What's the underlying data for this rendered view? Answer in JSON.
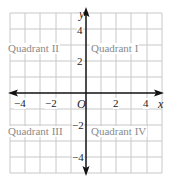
{
  "diagram": {
    "type": "coordinate-plane",
    "axes": {
      "x_label": "x",
      "y_label": "y",
      "origin_label": "O"
    },
    "x_ticks": [
      "−4",
      "−2",
      "2",
      "4"
    ],
    "y_ticks": [
      "4",
      "2",
      "−2",
      "−4"
    ],
    "quadrants": {
      "q1": "Quadrant I",
      "q2": "Quadrant II",
      "q3": "Quadrant III",
      "q4": "Quadrant IV"
    },
    "colors": {
      "grid": "#c8c8c8",
      "axis": "#111111",
      "quadrant_text": "#8a8a8a"
    }
  }
}
